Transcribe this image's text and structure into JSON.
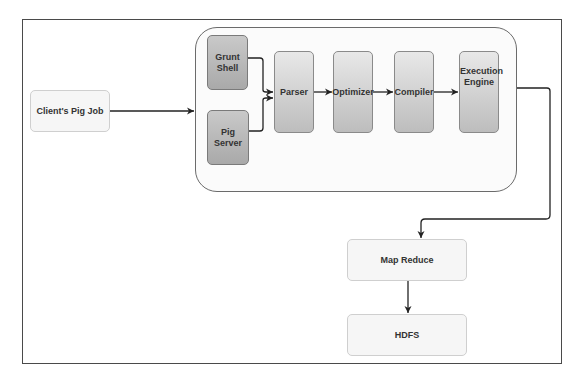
{
  "diagram": {
    "nodes": {
      "client_job": "Client's Pig Job",
      "grunt_shell": "Grunt Shell",
      "pig_server": "Pig Server",
      "parser": "Parser",
      "optimizer": "Optimizer",
      "compiler": "Compiler",
      "execution_engine": "Execution Engine",
      "map_reduce": "Map Reduce",
      "hdfs": "HDFS"
    },
    "edges": [
      {
        "from": "client_job",
        "to": "pig_container"
      },
      {
        "from": "grunt_shell",
        "to": "parser"
      },
      {
        "from": "pig_server",
        "to": "parser"
      },
      {
        "from": "parser",
        "to": "optimizer"
      },
      {
        "from": "optimizer",
        "to": "compiler"
      },
      {
        "from": "compiler",
        "to": "execution_engine"
      },
      {
        "from": "execution_engine",
        "to": "map_reduce"
      },
      {
        "from": "map_reduce",
        "to": "hdfs"
      }
    ],
    "colors": {
      "frame": "#4a4a4a",
      "container_border": "#6b6b6b",
      "edge": "#222222",
      "light_node": "#f6f6f6",
      "dark_node": "#b9b9b9",
      "text": "#333333"
    }
  }
}
